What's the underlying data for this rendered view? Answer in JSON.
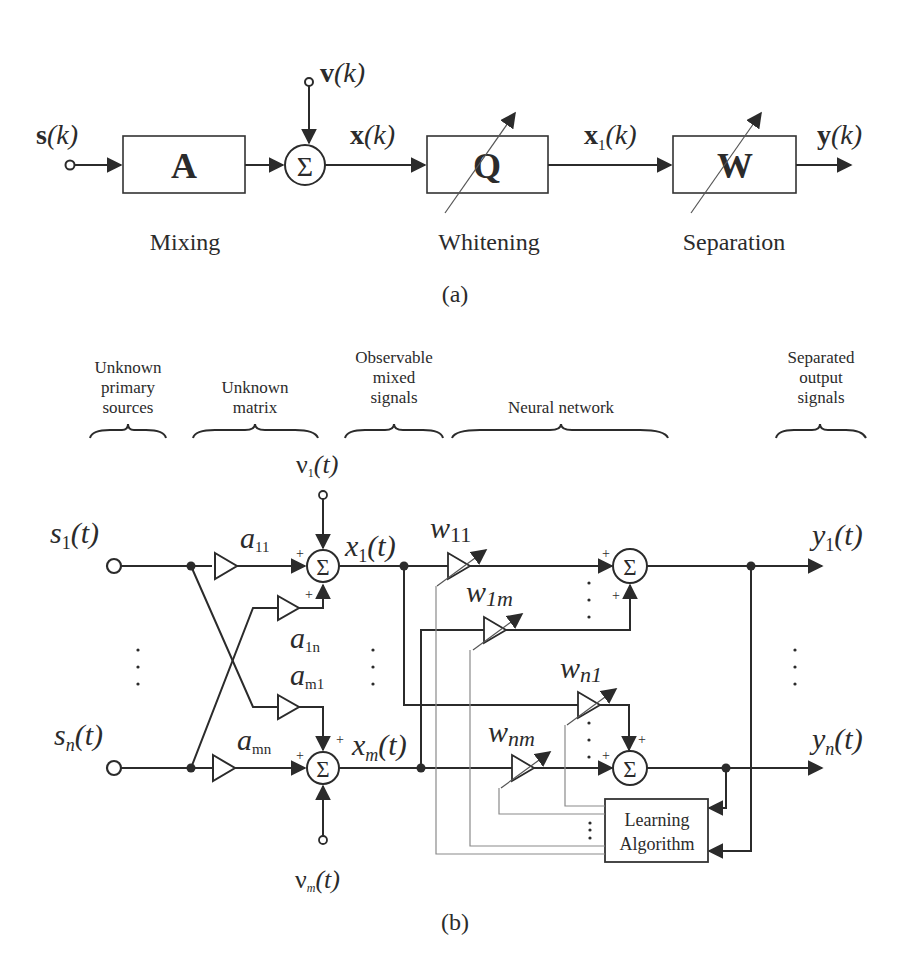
{
  "panel_a": {
    "caption": "(a)",
    "input": {
      "bold": "s",
      "arg": "(k)"
    },
    "noise": {
      "bold": "v",
      "arg": "(k)"
    },
    "mixed": {
      "bold": "x",
      "arg": "(k)"
    },
    "whitened": {
      "bold": "x",
      "sub": "1",
      "arg": "(k)"
    },
    "output": {
      "bold": "y",
      "arg": "(k)"
    },
    "sum_symbol": "Σ",
    "blocks": [
      {
        "symbol": "A",
        "label": "Mixing"
      },
      {
        "symbol": "Q",
        "label": "Whitening"
      },
      {
        "symbol": "W",
        "label": "Separation"
      }
    ]
  },
  "panel_b": {
    "caption": "(b)",
    "headers": [
      {
        "lines": [
          "Unknown",
          "primary",
          "sources"
        ]
      },
      {
        "lines": [
          "Unknown",
          "matrix"
        ]
      },
      {
        "lines": [
          "Observable",
          "mixed",
          "signals"
        ]
      },
      {
        "lines": [
          "Neural network"
        ]
      },
      {
        "lines": [
          "Separated",
          "output",
          "signals"
        ]
      }
    ],
    "sources": [
      {
        "base": "s",
        "sub": "1",
        "arg": "(t)"
      },
      {
        "base": "s",
        "sub": "n",
        "arg": "(t)"
      }
    ],
    "noises": [
      {
        "base": "ν",
        "sub": "1",
        "arg": "(t)"
      },
      {
        "base": "ν",
        "sub": "m",
        "arg": "(t)"
      }
    ],
    "mixing_gains": [
      {
        "base": "a",
        "sub": "11"
      },
      {
        "base": "a",
        "sub": "1n"
      },
      {
        "base": "a",
        "sub": "m1"
      },
      {
        "base": "a",
        "sub": "mn"
      }
    ],
    "mixed": [
      {
        "base": "x",
        "sub": "1",
        "arg": "(t)"
      },
      {
        "base": "x",
        "sub": "m",
        "arg": "(t)"
      }
    ],
    "weights": [
      {
        "base": "w",
        "sub": "11"
      },
      {
        "base": "w",
        "sub": "1m"
      },
      {
        "base": "w",
        "sub": "n1"
      },
      {
        "base": "w",
        "sub": "nm"
      }
    ],
    "outputs": [
      {
        "base": "y",
        "sub": "1",
        "arg": "(t)"
      },
      {
        "base": "y",
        "sub": "n",
        "arg": "(t)"
      }
    ],
    "learning_block": {
      "lines": [
        "Learning",
        "Algorithm"
      ]
    },
    "sum_symbol": "Σ",
    "plus": "+"
  }
}
